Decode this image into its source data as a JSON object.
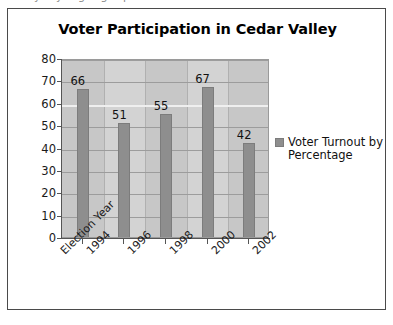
{
  "top_crop": {
    "ghost_text": "y   y   g g p"
  },
  "figure": {
    "title": "Voter Participation in Cedar Valley"
  },
  "legend": {
    "swatch_name": "legend-color-swatch",
    "label": "Voter Turnout by Percentage",
    "color": "#8e8e8e"
  },
  "axes": {
    "y_ticks": [
      "80",
      "70",
      "60",
      "50",
      "40",
      "30",
      "20",
      "10",
      "0"
    ],
    "x_axis_caption": "Election Year",
    "x_categories": [
      "1994",
      "1996",
      "1998",
      "2000",
      "2002"
    ]
  },
  "colors": {
    "bar": "#8e8e8e",
    "plot_background": "#d3d3d3",
    "band": "#c7c7c7",
    "gridline": "#9c9c9c",
    "axis": "#555555",
    "frame": "#4a4a4a",
    "text": "#111111"
  },
  "chart_data": {
    "type": "bar",
    "title": "Voter Participation in Cedar Valley",
    "xlabel": "Election Year",
    "ylabel": "",
    "categories": [
      "1994",
      "1996",
      "1998",
      "2000",
      "2002"
    ],
    "values": [
      66,
      51,
      55,
      67,
      42
    ],
    "data_labels": [
      "66",
      "51",
      "55",
      "67",
      "42"
    ],
    "ylim": [
      0,
      80
    ],
    "ytick_step": 10,
    "yticks": [
      0,
      10,
      20,
      30,
      40,
      50,
      60,
      70,
      80
    ],
    "grid": "horizontal-and-vertical",
    "legend_position": "right",
    "series": [
      {
        "name": "Voter Turnout by Percentage",
        "values": [
          66,
          51,
          55,
          67,
          42
        ],
        "color": "#8e8e8e"
      }
    ]
  }
}
